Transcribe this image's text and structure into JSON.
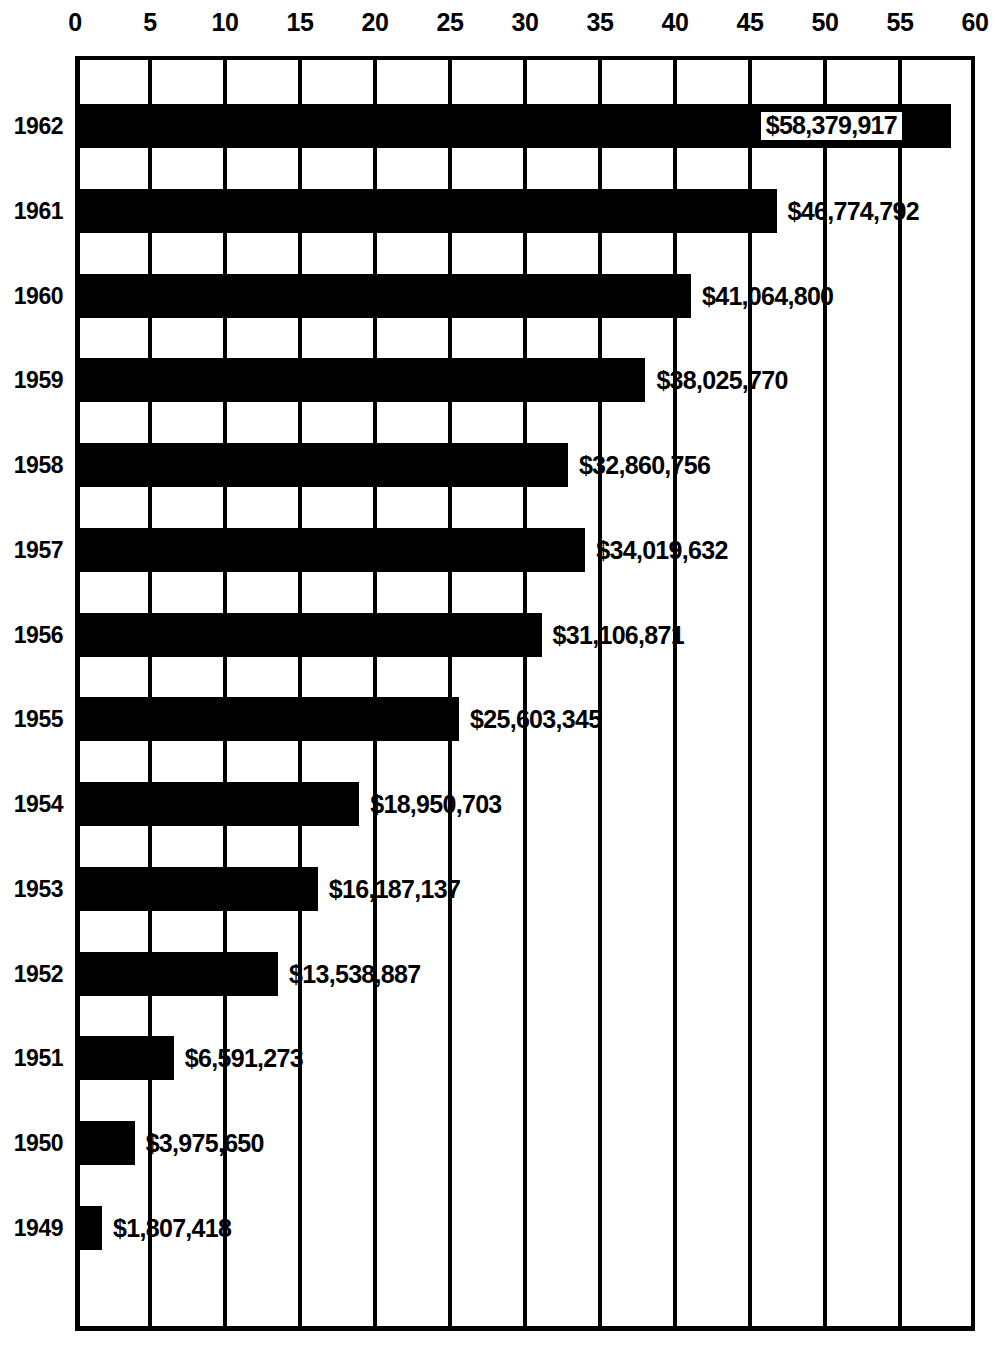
{
  "chart_data": {
    "type": "bar",
    "orientation": "horizontal",
    "title": "",
    "xlabel": "",
    "ylabel": "",
    "xlim": [
      0,
      60
    ],
    "xticks": [
      0,
      5,
      10,
      15,
      20,
      25,
      30,
      35,
      40,
      45,
      50,
      55,
      60
    ],
    "xtick_labels": [
      "0",
      "5",
      "10",
      "15",
      "20",
      "25",
      "30",
      "35",
      "40",
      "45",
      "50",
      "55",
      "60"
    ],
    "unit_note": "values in millions of dollars",
    "grid": true,
    "grid_axis": "x",
    "legend": null,
    "categories": [
      "1962",
      "1961",
      "1960",
      "1959",
      "1958",
      "1957",
      "1956",
      "1955",
      "1954",
      "1953",
      "1952",
      "1951",
      "1950",
      "1949"
    ],
    "values": [
      58.379917,
      46.774792,
      41.0648,
      38.02577,
      32.860756,
      34.019632,
      31.106871,
      25.603345,
      18.950703,
      16.187137,
      13.538887,
      6.591273,
      3.97565,
      1.807418
    ],
    "bars": [
      {
        "year": "1962",
        "value": 58.379917,
        "label": "$58,379,917",
        "label_style": "inside-white-box"
      },
      {
        "year": "1961",
        "value": 46.774792,
        "label": "$46,774,792",
        "label_style": "outside"
      },
      {
        "year": "1960",
        "value": 41.0648,
        "label": "$41,064,800",
        "label_style": "outside"
      },
      {
        "year": "1959",
        "value": 38.02577,
        "label": "$38,025,770",
        "label_style": "outside"
      },
      {
        "year": "1958",
        "value": 32.860756,
        "label": "$32,860,756",
        "label_style": "outside"
      },
      {
        "year": "1957",
        "value": 34.019632,
        "label": "$34,019,632",
        "label_style": "outside"
      },
      {
        "year": "1956",
        "value": 31.106871,
        "label": "$31,106,871",
        "label_style": "outside"
      },
      {
        "year": "1955",
        "value": 25.603345,
        "label": "$25,603,345",
        "label_style": "outside"
      },
      {
        "year": "1954",
        "value": 18.950703,
        "label": "$18,950,703",
        "label_style": "outside"
      },
      {
        "year": "1953",
        "value": 16.187137,
        "label": "$16,187,137",
        "label_style": "outside"
      },
      {
        "year": "1952",
        "value": 13.538887,
        "label": "$13,538,887",
        "label_style": "outside"
      },
      {
        "year": "1951",
        "value": 6.591273,
        "label": "$6,591,273",
        "label_style": "outside"
      },
      {
        "year": "1950",
        "value": 3.97565,
        "label": "$3,975,650",
        "label_style": "outside"
      },
      {
        "year": "1949",
        "value": 1.807418,
        "label": "$1,807,418",
        "label_style": "outside"
      }
    ],
    "colors": {
      "bar": "#000000",
      "background": "#ffffff",
      "axis": "#000000",
      "grid": "#000000",
      "label_text": "#000000",
      "boxed_label_bg": "#ffffff"
    }
  }
}
